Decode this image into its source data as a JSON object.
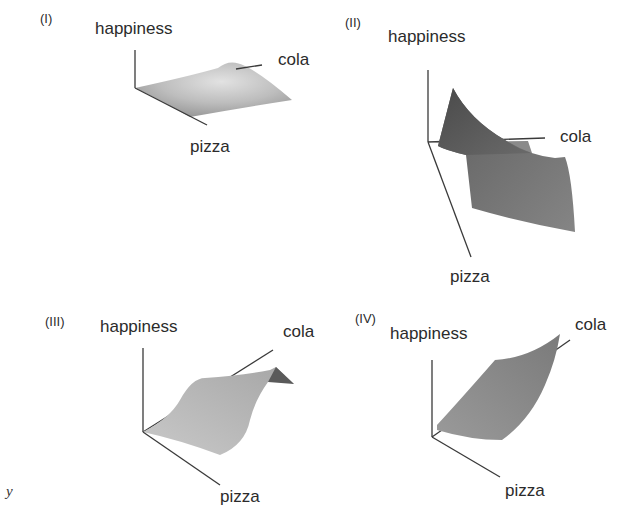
{
  "figure": {
    "panels": [
      {
        "id": "I",
        "label": "(I)",
        "axes": {
          "z": "happiness",
          "x": "cola",
          "y": "pizza"
        },
        "surface": "flat plane with single central bump (peak)",
        "fill_color": "#b9b9b9"
      },
      {
        "id": "II",
        "label": "(II)",
        "axes": {
          "z": "happiness",
          "x": "cola",
          "y": "pizza"
        },
        "surface": "sharp peak near origin dropping steeply, surface hanging below plane",
        "fill_color": "#6e6e6e"
      },
      {
        "id": "III",
        "label": "(III)",
        "axes": {
          "z": "happiness",
          "x": "cola",
          "y": "pizza"
        },
        "surface": "rising S-shaped ridge that levels off along cola",
        "fill_color": "#b4b4b4"
      },
      {
        "id": "IV",
        "label": "(IV)",
        "axes": {
          "z": "happiness",
          "x": "cola",
          "y": "pizza"
        },
        "surface": "monotonically increasing convex surface rising toward cola",
        "fill_color": "#8a8a8a"
      }
    ],
    "stray_text": "y"
  }
}
